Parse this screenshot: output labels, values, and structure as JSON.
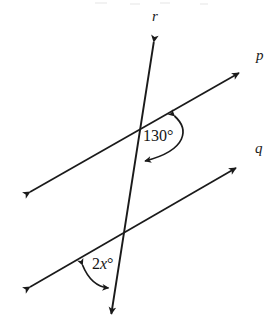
{
  "figure": {
    "type": "geometry-diagram",
    "background_color": "#ffffff",
    "stroke_color": "#1a1a1a",
    "width": 278,
    "height": 334
  },
  "lines": [
    {
      "id": "r",
      "label": "r",
      "label_x": 152,
      "label_y": 10,
      "role": "transversal",
      "x1": 155,
      "y1": 34,
      "x2": 110,
      "y2": 322,
      "arrow_start": true,
      "arrow_end": true
    },
    {
      "id": "p",
      "label": "p",
      "label_x": 255,
      "label_y": 48,
      "role": "parallel-line-upper",
      "x1": 22,
      "y1": 197,
      "x2": 247,
      "y2": 68,
      "arrow_start": true,
      "arrow_end": true
    },
    {
      "id": "q",
      "label": "q",
      "label_x": 254,
      "label_y": 142,
      "role": "parallel-line-lower",
      "x1": 22,
      "y1": 292,
      "x2": 244,
      "y2": 163,
      "arrow_start": true,
      "arrow_end": true
    }
  ],
  "intersections": [
    {
      "id": "upper",
      "lines": [
        "r",
        "p"
      ],
      "x": 142,
      "y": 127
    },
    {
      "id": "lower",
      "lines": [
        "r",
        "q"
      ],
      "x": 122,
      "y": 237
    }
  ],
  "angles": [
    {
      "id": "angle-130",
      "value_text": "130°",
      "value": 130,
      "unit": "degrees",
      "at_intersection": "upper",
      "label_x": 143,
      "label_y": 128,
      "arc_path": "M 174.5 114.5 C 190 128 190 150 143.5 162.5",
      "arrow_at_start": true,
      "arrow_at_end": true
    },
    {
      "id": "angle-2x",
      "value_text": "2x°",
      "expression_coefficient": "2",
      "expression_variable": "x",
      "expression_degree": "°",
      "at_intersection": "lower",
      "label_x": 92,
      "label_y": 255,
      "arc_path": "M 81.5 263.5 C 88 281 98 288 110 288.5",
      "arrow_at_start": true,
      "arrow_at_end": true
    }
  ]
}
